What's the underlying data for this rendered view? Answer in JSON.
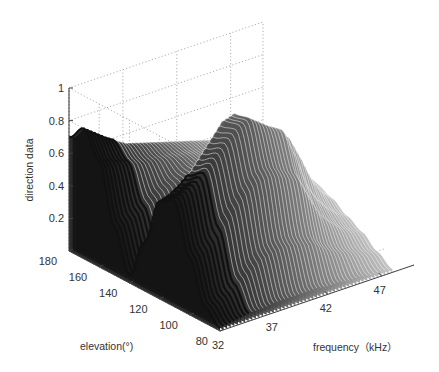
{
  "chart_data": {
    "type": "surface3d",
    "title": "",
    "xlabel": "frequency（kHz）",
    "ylabel": "elevation(°)",
    "zlabel": "direction data",
    "x_ticks": [
      "32",
      "37",
      "42",
      "47"
    ],
    "y_ticks": [
      "80",
      "100",
      "120",
      "140",
      "160",
      "180"
    ],
    "z_ticks": [
      "0.2",
      "0.4",
      "0.6",
      "0.8",
      "1"
    ],
    "xlim": [
      32,
      50
    ],
    "ylim": [
      80,
      180
    ],
    "zlim": [
      0,
      1
    ],
    "grid": true,
    "colormap": "grayscale (dark at low frequency to light at high frequency)",
    "series_description": "Waterfall of direction-data curves vs elevation, one slice per frequency",
    "x": [
      32,
      33,
      34,
      35,
      36,
      37,
      38,
      39,
      40,
      41,
      42,
      43,
      44,
      45,
      46,
      47,
      48
    ],
    "y": [
      80,
      90,
      100,
      110,
      120,
      130,
      140,
      150,
      160,
      170,
      180
    ],
    "z": [
      [
        0.02,
        0.1,
        0.35,
        0.65,
        0.6,
        0.3,
        0.05,
        0.3,
        0.65,
        0.8,
        0.7
      ],
      [
        0.03,
        0.12,
        0.38,
        0.68,
        0.62,
        0.32,
        0.08,
        0.32,
        0.62,
        0.75,
        0.65
      ],
      [
        0.04,
        0.15,
        0.42,
        0.72,
        0.66,
        0.38,
        0.12,
        0.35,
        0.6,
        0.7,
        0.6
      ],
      [
        0.05,
        0.2,
        0.5,
        0.78,
        0.72,
        0.45,
        0.18,
        0.38,
        0.58,
        0.66,
        0.55
      ],
      [
        0.05,
        0.25,
        0.58,
        0.85,
        0.8,
        0.55,
        0.25,
        0.42,
        0.56,
        0.62,
        0.52
      ],
      [
        0.06,
        0.3,
        0.65,
        0.92,
        0.88,
        0.65,
        0.35,
        0.45,
        0.55,
        0.6,
        0.5
      ],
      [
        0.06,
        0.32,
        0.7,
        0.98,
        0.96,
        0.75,
        0.45,
        0.48,
        0.54,
        0.58,
        0.48
      ],
      [
        0.06,
        0.33,
        0.72,
        1.0,
        0.98,
        0.8,
        0.5,
        0.5,
        0.53,
        0.56,
        0.46
      ],
      [
        0.06,
        0.32,
        0.7,
        0.95,
        0.92,
        0.78,
        0.52,
        0.5,
        0.52,
        0.54,
        0.44
      ],
      [
        0.06,
        0.3,
        0.66,
        0.9,
        0.88,
        0.75,
        0.52,
        0.48,
        0.5,
        0.52,
        0.42
      ],
      [
        0.05,
        0.28,
        0.62,
        0.86,
        0.84,
        0.72,
        0.5,
        0.46,
        0.48,
        0.5,
        0.4
      ],
      [
        0.05,
        0.22,
        0.48,
        0.7,
        0.8,
        0.7,
        0.48,
        0.44,
        0.46,
        0.48,
        0.38
      ],
      [
        0.04,
        0.18,
        0.35,
        0.5,
        0.72,
        0.68,
        0.46,
        0.42,
        0.44,
        0.46,
        0.36
      ],
      [
        0.04,
        0.15,
        0.28,
        0.38,
        0.58,
        0.62,
        0.44,
        0.4,
        0.42,
        0.44,
        0.34
      ],
      [
        0.03,
        0.12,
        0.22,
        0.3,
        0.42,
        0.5,
        0.42,
        0.38,
        0.4,
        0.42,
        0.32
      ],
      [
        0.03,
        0.1,
        0.18,
        0.24,
        0.32,
        0.38,
        0.36,
        0.34,
        0.36,
        0.38,
        0.3
      ],
      [
        0.02,
        0.08,
        0.15,
        0.2,
        0.26,
        0.3,
        0.3,
        0.3,
        0.32,
        0.34,
        0.28
      ]
    ]
  }
}
